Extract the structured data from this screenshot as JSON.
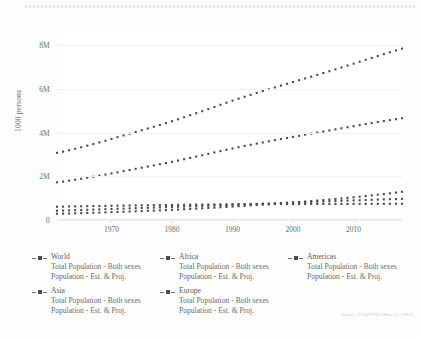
{
  "axis": {
    "y_title": "1000 persons",
    "y_ticks": [
      "0",
      "2M",
      "4M",
      "6M",
      "8M"
    ],
    "x_ticks": [
      "1970",
      "1980",
      "1990",
      "2000",
      "2010"
    ]
  },
  "source": {
    "text": "Source: FAOSTAT (Mar 11, 2019)"
  },
  "legend": {
    "entries": [
      {
        "name": "World",
        "line1": "Total Population - Both sexes",
        "line2": "Population - Est. & Proj."
      },
      {
        "name": "Africa",
        "line1": "Total Population - Both sexes",
        "line2": "Population - Est. & Proj."
      },
      {
        "name": "Americas",
        "line1": "Total Population - Both sexes",
        "line2": "Population - Est. & Proj."
      },
      {
        "name": "Asia",
        "line1": "Total Population - Both sexes",
        "line2": "Population - Est. & Proj."
      },
      {
        "name": "Europe",
        "line1": "Total Population - Both sexes",
        "line2": "Population - Est. & Proj."
      }
    ]
  },
  "chart_data": {
    "type": "line",
    "title": "",
    "xlabel": "",
    "ylabel": "1000 persons",
    "xlim": [
      1961,
      2018
    ],
    "ylim": [
      0,
      8600000
    ],
    "ytick_values": [
      0,
      2000000,
      4000000,
      6000000,
      8000000
    ],
    "ytick_labels": [
      "0",
      "2M",
      "4M",
      "6M",
      "8M"
    ],
    "xtick_values": [
      1970,
      1980,
      1990,
      2000,
      2010
    ],
    "grid": true,
    "legend_position": "below",
    "marker": "square-dotted",
    "color": "#4c4d4f",
    "x": [
      1961,
      1962,
      1963,
      1964,
      1965,
      1966,
      1967,
      1968,
      1969,
      1970,
      1971,
      1972,
      1973,
      1974,
      1975,
      1976,
      1977,
      1978,
      1979,
      1980,
      1981,
      1982,
      1983,
      1984,
      1985,
      1986,
      1987,
      1988,
      1989,
      1990,
      1991,
      1992,
      1993,
      1994,
      1995,
      1996,
      1997,
      1998,
      1999,
      2000,
      2001,
      2002,
      2003,
      2004,
      2005,
      2006,
      2007,
      2008,
      2009,
      2010,
      2011,
      2012,
      2013,
      2014,
      2015,
      2016,
      2017,
      2018
    ],
    "series": [
      {
        "name": "World",
        "values": [
          3075000,
          3128000,
          3193000,
          3260000,
          3329000,
          3400000,
          3473000,
          3549000,
          3627000,
          3706000,
          3788000,
          3869000,
          3949000,
          4028000,
          4107000,
          4186000,
          4266000,
          4348000,
          4433000,
          4519000,
          4607000,
          4699000,
          4792000,
          4885000,
          4978000,
          5073000,
          5171000,
          5269000,
          5365000,
          5459000,
          5551000,
          5640000,
          5727000,
          5813000,
          5898000,
          5982000,
          6065000,
          6148000,
          6230000,
          6312000,
          6394000,
          6476000,
          6558000,
          6640000,
          6723000,
          6807000,
          6892000,
          6978000,
          7065000,
          7152000,
          7240000,
          7328000,
          7415000,
          7502000,
          7588000,
          7673000,
          7756000,
          7838000
        ]
      },
      {
        "name": "Asia",
        "values": [
          1723000,
          1757000,
          1799000,
          1842000,
          1886000,
          1932000,
          1979000,
          2028000,
          2078000,
          2129000,
          2182000,
          2235000,
          2288000,
          2341000,
          2394000,
          2446000,
          2498000,
          2551000,
          2606000,
          2661000,
          2719000,
          2780000,
          2841000,
          2902000,
          2963000,
          3025000,
          3089000,
          3152000,
          3213000,
          3272000,
          3330000,
          3386000,
          3441000,
          3495000,
          3548000,
          3601000,
          3652000,
          3703000,
          3753000,
          3803000,
          3852000,
          3901000,
          3950000,
          3998000,
          4047000,
          4096000,
          4145000,
          4194000,
          4243000,
          4292000,
          4340000,
          4388000,
          4435000,
          4481000,
          4526000,
          4570000,
          4613000,
          4654000
        ]
      },
      {
        "name": "Africa",
        "values": [
          285000,
          292000,
          299000,
          307000,
          315000,
          323000,
          331000,
          340000,
          349000,
          358000,
          367000,
          377000,
          387000,
          397000,
          408000,
          419000,
          430000,
          442000,
          454000,
          466000,
          479000,
          492000,
          506000,
          520000,
          534000,
          549000,
          565000,
          581000,
          597000,
          614000,
          631000,
          648000,
          666000,
          684000,
          702000,
          721000,
          740000,
          760000,
          780000,
          800000,
          821000,
          843000,
          865000,
          888000,
          912000,
          936000,
          961000,
          987000,
          1013000,
          1040000,
          1068000,
          1097000,
          1127000,
          1158000,
          1189000,
          1221000,
          1254000,
          1288000
        ]
      },
      {
        "name": "Americas",
        "values": [
          424000,
          433000,
          442000,
          451000,
          460000,
          469000,
          477000,
          486000,
          495000,
          504000,
          514000,
          523000,
          532000,
          541000,
          550000,
          559000,
          568000,
          578000,
          587000,
          597000,
          607000,
          617000,
          627000,
          636000,
          646000,
          656000,
          666000,
          676000,
          686000,
          697000,
          707000,
          717000,
          728000,
          738000,
          748000,
          758000,
          768000,
          778000,
          788000,
          798000,
          808000,
          818000,
          827000,
          837000,
          847000,
          857000,
          866000,
          876000,
          886000,
          896000,
          905000,
          915000,
          924000,
          933000,
          942000,
          951000,
          959000,
          967000
        ]
      },
      {
        "name": "Europe",
        "values": [
          606000,
          612000,
          618000,
          623000,
          628000,
          633000,
          638000,
          642000,
          647000,
          652000,
          657000,
          661000,
          665000,
          669000,
          673000,
          677000,
          680000,
          683000,
          686000,
          690000,
          693000,
          696000,
          699000,
          702000,
          705000,
          708000,
          711000,
          714000,
          717000,
          720000,
          722000,
          724000,
          725000,
          726000,
          727000,
          727000,
          728000,
          728000,
          728000,
          729000,
          729000,
          729000,
          730000,
          730000,
          731000,
          732000,
          733000,
          734000,
          735000,
          736000,
          737000,
          738000,
          739000,
          740000,
          741000,
          742000,
          743000,
          744000
        ]
      }
    ]
  }
}
